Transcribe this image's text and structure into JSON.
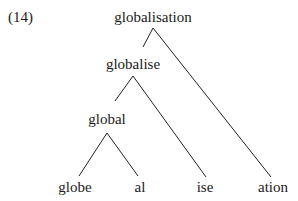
{
  "example_number": "(14)",
  "tree": {
    "root": {
      "label": "globalisation",
      "children": [
        "globalise",
        "ation"
      ]
    },
    "nodes": {
      "globalisation": {
        "label": "globalisation"
      },
      "globalise": {
        "label": "globalise"
      },
      "global": {
        "label": "global"
      },
      "globe": {
        "label": "globe"
      },
      "al": {
        "label": "al"
      },
      "ise": {
        "label": "ise"
      },
      "ation": {
        "label": "ation"
      }
    },
    "edges": [
      {
        "from": "globalisation",
        "to": "globalise"
      },
      {
        "from": "globalisation",
        "to": "ation"
      },
      {
        "from": "globalise",
        "to": "global"
      },
      {
        "from": "globalise",
        "to": "ise"
      },
      {
        "from": "global",
        "to": "globe"
      },
      {
        "from": "global",
        "to": "al"
      }
    ]
  },
  "colors": {
    "text": "#1a1a1a",
    "line": "#222222",
    "background": "#ffffff"
  }
}
